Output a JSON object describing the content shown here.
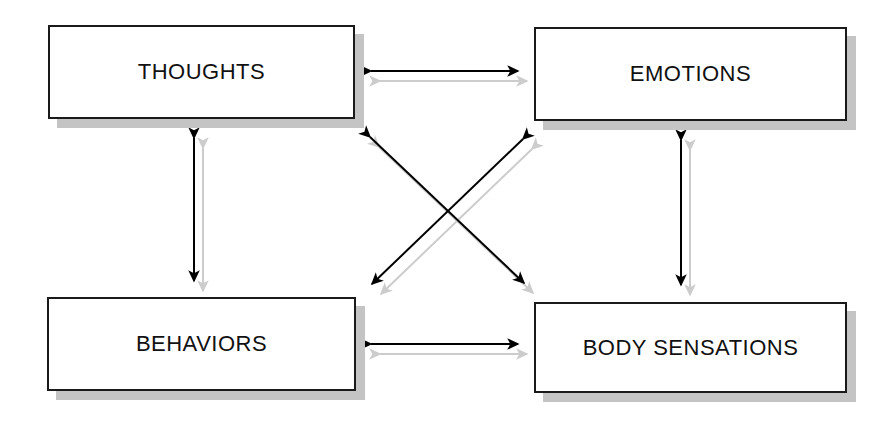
{
  "diagram": {
    "background_color": "#ffffff",
    "box_border_color": "#1a1a1a",
    "box_fill_color": "#ffffff",
    "shadow_color": "#c4c4c4",
    "arrow_color": "#000000",
    "arrow_shadow_color": "#cccccc",
    "nodes": [
      {
        "id": "thoughts",
        "label": "THOUGHTS",
        "x": 48,
        "y": 25,
        "width": 307,
        "height": 94
      },
      {
        "id": "emotions",
        "label": "EMOTIONS",
        "x": 534,
        "y": 27,
        "width": 313,
        "height": 94
      },
      {
        "id": "behaviors",
        "label": "BEHAVIORS",
        "x": 47,
        "y": 297,
        "width": 309,
        "height": 94
      },
      {
        "id": "body_sensations",
        "label": "BODY SENSATIONS",
        "x": 534,
        "y": 302,
        "width": 313,
        "height": 91
      }
    ],
    "connectors": [
      {
        "id": "thoughts-emotions",
        "from": "thoughts",
        "to": "emotions",
        "orientation": "horizontal",
        "bidirectional": true,
        "x1": 371,
        "y1": 71,
        "x2": 518,
        "y2": 71
      },
      {
        "id": "behaviors-body-sensations",
        "from": "behaviors",
        "to": "body_sensations",
        "orientation": "horizontal",
        "bidirectional": true,
        "x1": 371,
        "y1": 344,
        "x2": 518,
        "y2": 344
      },
      {
        "id": "thoughts-behaviors",
        "from": "thoughts",
        "to": "behaviors",
        "orientation": "vertical",
        "bidirectional": true,
        "x1": 194,
        "y1": 138,
        "x2": 194,
        "y2": 281
      },
      {
        "id": "emotions-body-sensations",
        "from": "emotions",
        "to": "body_sensations",
        "orientation": "vertical",
        "bidirectional": true,
        "x1": 681,
        "y1": 140,
        "x2": 681,
        "y2": 285
      },
      {
        "id": "thoughts-body-sensations",
        "from": "thoughts",
        "to": "body_sensations",
        "orientation": "diagonal",
        "bidirectional": true,
        "x1": 370,
        "y1": 137,
        "x2": 524,
        "y2": 283
      },
      {
        "id": "emotions-behaviors",
        "from": "emotions",
        "to": "behaviors",
        "orientation": "diagonal",
        "bidirectional": true,
        "x1": 523,
        "y1": 139,
        "x2": 372,
        "y2": 284
      }
    ]
  }
}
